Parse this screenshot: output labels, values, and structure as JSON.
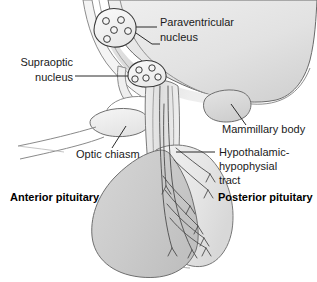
{
  "figure": {
    "kind": "anatomical-diagram",
    "background_color": "#ffffff",
    "outline_color": "#4a4a4a",
    "text_color": "#1a1a1a",
    "fill_light": "#f1f1f1",
    "fill_mid": "#d9d9d9",
    "fill_dark": "#c6c6c6"
  },
  "labels": {
    "paraventricular_nucleus": {
      "lines": [
        "Paraventricular",
        "nucleus"
      ],
      "line1": "Paraventricular",
      "line2": "nucleus",
      "bold": false,
      "align": "left"
    },
    "supraoptic_nucleus": {
      "lines": [
        "Supraoptic",
        "nucleus"
      ],
      "line1": "Supraoptic",
      "line2": "nucleus",
      "bold": false,
      "align": "right"
    },
    "mammillary_body": {
      "lines": [
        "Mammillary body"
      ],
      "line1": "Mammillary body",
      "bold": false,
      "align": "left"
    },
    "hypothalamic_hypophysial_tract": {
      "lines": [
        "Hypothalamic-",
        "hypophysial",
        "tract"
      ],
      "line1": "Hypothalamic-",
      "line2": "hypophysial",
      "line3": "tract",
      "bold": false,
      "align": "left"
    },
    "optic_chiasm": {
      "lines": [
        "Optic chiasm"
      ],
      "line1": "Optic chiasm",
      "bold": false,
      "align": "left"
    },
    "anterior_pituitary": {
      "lines": [
        "Anterior pituitary"
      ],
      "line1": "Anterior pituitary",
      "bold": true,
      "align": "left"
    },
    "posterior_pituitary": {
      "lines": [
        "Posterior pituitary"
      ],
      "line1": "Posterior pituitary",
      "bold": true,
      "align": "left"
    }
  },
  "structures": {
    "paraventricular_nucleus": {
      "name": "Paraventricular nucleus",
      "cell_count": 5
    },
    "supraoptic_nucleus": {
      "name": "Supraoptic nucleus",
      "cell_count": 5
    },
    "optic_chiasm": {
      "name": "Optic chiasm"
    },
    "mammillary_body": {
      "name": "Mammillary body"
    },
    "anterior_pituitary": {
      "name": "Anterior pituitary"
    },
    "posterior_pituitary": {
      "name": "Posterior pituitary"
    },
    "infundibulum": {
      "name": "Infundibular stalk"
    },
    "hypothalamus": {
      "name": "Hypothalamus"
    }
  }
}
